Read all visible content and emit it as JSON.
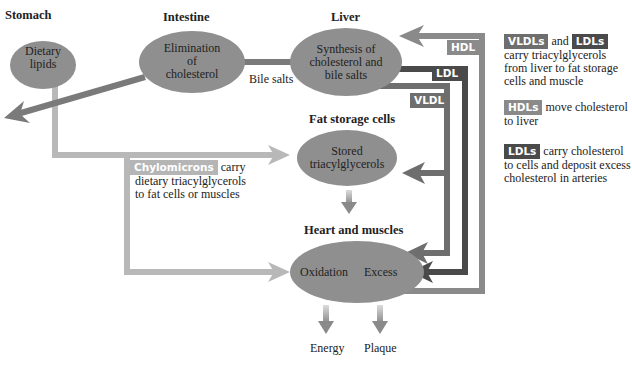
{
  "headings": {
    "stomach": "Stomach",
    "intestine": "Intestine",
    "liver": "Liver",
    "fat_storage": "Fat storage cells",
    "heart_muscles": "Heart and muscles"
  },
  "nodes": {
    "dietary_lipids": [
      "Dietary",
      "lipids"
    ],
    "elimination": [
      "Elimination",
      "of",
      "cholesterol"
    ],
    "synthesis": [
      "Synthesis of",
      "cholesterol and",
      "bile salts"
    ],
    "stored": [
      "Stored",
      "triacylglycerols"
    ],
    "oxidation": "Oxidation",
    "excess": "Excess"
  },
  "labels": {
    "bile_salts": "Bile salts",
    "hdl": "HDL",
    "ldl": "LDL",
    "vldl": "VLDL",
    "energy": "Energy",
    "plaque": "Plaque",
    "chylomicrons": "Chylomicrons",
    "chylo_text_1": "carry",
    "chylo_text_2": "dietary triacylglycerols",
    "chylo_text_3": "to fat cells or muscles"
  },
  "legend": {
    "item1": {
      "badge_a": "VLDLs",
      "joiner": "and",
      "badge_b": "LDLs",
      "lines": [
        "carry triacylglycerols",
        "from liver to fat storage",
        "cells and muscle"
      ]
    },
    "item2": {
      "badge": "HDLs",
      "first": "move cholesterol",
      "lines": [
        "to liver"
      ]
    },
    "item3": {
      "badge": "LDLs",
      "first": "carry cholesterol",
      "lines": [
        "to cells and deposit excess",
        "cholesterol in arteries"
      ]
    }
  },
  "colors": {
    "node_fill": "#8f8f8f",
    "chylo_path": "#b5b5b5",
    "hdl": "#8a8a8a",
    "ldl": "#4a4a4a",
    "vldl": "#6e6e6e",
    "bile": "#7a7a7a"
  }
}
